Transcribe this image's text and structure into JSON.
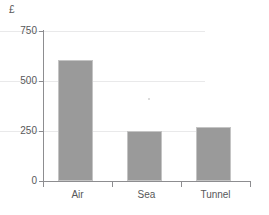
{
  "chart_data": {
    "type": "bar",
    "title": "",
    "subtitle": "",
    "xlabel": "",
    "ylabel": "£",
    "unit_symbol": "£",
    "categories": [
      "Air",
      "Sea",
      "Tunnel"
    ],
    "values": [
      605,
      250,
      268
    ],
    "series": [
      {
        "name": "Cost",
        "values": [
          605,
          250,
          268
        ],
        "color": "#9a9a9a"
      }
    ],
    "ylim": [
      0,
      750
    ],
    "yticks": [
      750,
      500,
      250,
      0
    ],
    "ytick_labels": [
      "750",
      "500",
      "250",
      "0"
    ],
    "grid": true,
    "grid_axis": "y",
    "grid_color": "#e9e9ea",
    "legend": false,
    "legend_position": "none",
    "axis_color": "#8d8d90",
    "bar_color": "#9a9a9a",
    "bar_edge_color": "#c4c4c4",
    "background_color": "#ffffff",
    "text_color": "#58585a",
    "annotations": []
  }
}
